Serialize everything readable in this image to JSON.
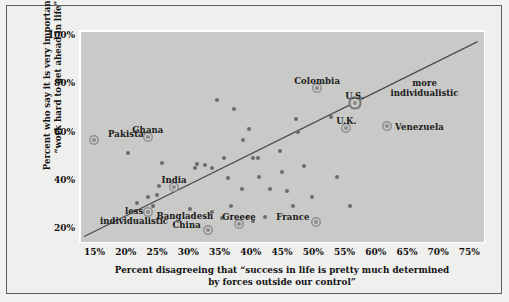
{
  "chart_data": {
    "type": "scatter",
    "title": "",
    "xlabel": "Percent disagreeing that “success in life is pretty much determined by forces outside our control”",
    "xlabel_line1": "Percent disagreeing that “success in life is pretty much determined",
    "xlabel_line2": "by forces outside our control”",
    "ylabel": "Percent who say it is very important to “work hard to get ahead in life”",
    "ylabel_line1": "Percent who say it is very important to",
    "ylabel_line2": "“work hard to get ahead in life”",
    "xlim": [
      12.5,
      77.5
    ],
    "ylim": [
      14,
      102
    ],
    "xticks": [
      "15%",
      "20%",
      "25%",
      "30%",
      "35%",
      "40%",
      "45%",
      "50%",
      "55%",
      "60%",
      "65%",
      "70%",
      "75%"
    ],
    "xtick_values": [
      15,
      20,
      25,
      30,
      35,
      40,
      45,
      50,
      55,
      60,
      65,
      70,
      75
    ],
    "yticks": [
      "100%",
      "80%",
      "60%",
      "40%",
      "20%"
    ],
    "ytick_values": [
      100,
      80,
      60,
      40,
      20
    ],
    "grid": false,
    "legend": "none",
    "trendline": {
      "x0": 13.0,
      "y0": 17.5,
      "x1": 76.0,
      "y1": 98.0
    },
    "labeled_points": [
      {
        "name": "Pakistan",
        "x": 14.6,
        "y": 57.5,
        "label_dx": 14,
        "label_dy": -11,
        "label_align": "left",
        "highlight": "normal"
      },
      {
        "name": "Ghana",
        "x": 23.2,
        "y": 58.5,
        "label_dx": 0,
        "label_dy": -12,
        "label_align": "center",
        "highlight": "normal"
      },
      {
        "name": "India",
        "x": 27.4,
        "y": 38.0,
        "label_dx": 0,
        "label_dy": -12,
        "label_align": "center",
        "highlight": "normal"
      },
      {
        "name": "Bangladesh",
        "x": 23.3,
        "y": 27.5,
        "label_dx": 8,
        "label_dy": -1,
        "label_align": "left",
        "highlight": "normal"
      },
      {
        "name": "China",
        "x": 32.8,
        "y": 20.0,
        "label_dx": -7,
        "label_dy": -10,
        "label_align": "right",
        "highlight": "normal"
      },
      {
        "name": "Greece",
        "x": 37.8,
        "y": 22.5,
        "label_dx": 0,
        "label_dy": -12,
        "label_align": "center",
        "highlight": "normal"
      },
      {
        "name": "France",
        "x": 50.2,
        "y": 23.5,
        "label_dx": -7,
        "label_dy": -10,
        "label_align": "right",
        "highlight": "normal"
      },
      {
        "name": "Colombia",
        "x": 50.3,
        "y": 79.0,
        "label_dx": 0,
        "label_dy": -12,
        "label_align": "center",
        "highlight": "normal"
      },
      {
        "name": "U.S.",
        "x": 56.3,
        "y": 72.5,
        "label_dx": 0,
        "label_dy": -12,
        "label_align": "center",
        "highlight": "big"
      },
      {
        "name": "U.K.",
        "x": 55.0,
        "y": 62.5,
        "label_dx": 0,
        "label_dy": -12,
        "label_align": "center",
        "highlight": "normal"
      },
      {
        "name": "Venezuela",
        "x": 61.5,
        "y": 63.0,
        "label_dx": 8,
        "label_dy": -4,
        "label_align": "left",
        "highlight": "normal"
      }
    ],
    "unlabeled_points": [
      {
        "x": 20.0,
        "y": 52.0
      },
      {
        "x": 25.4,
        "y": 48.0
      },
      {
        "x": 25.0,
        "y": 38.5
      },
      {
        "x": 23.3,
        "y": 34.0
      },
      {
        "x": 24.6,
        "y": 34.5
      },
      {
        "x": 21.5,
        "y": 31.5
      },
      {
        "x": 24.0,
        "y": 30.0
      },
      {
        "x": 30.0,
        "y": 29.0
      },
      {
        "x": 31.0,
        "y": 47.5
      },
      {
        "x": 30.7,
        "y": 45.8
      },
      {
        "x": 32.3,
        "y": 47.0
      },
      {
        "x": 33.4,
        "y": 45.8
      },
      {
        "x": 33.5,
        "y": 27.5
      },
      {
        "x": 35.0,
        "y": 25.0
      },
      {
        "x": 35.4,
        "y": 50.0
      },
      {
        "x": 37.0,
        "y": 70.0
      },
      {
        "x": 36.5,
        "y": 30.0
      },
      {
        "x": 39.4,
        "y": 62.0
      },
      {
        "x": 38.5,
        "y": 57.5
      },
      {
        "x": 40.0,
        "y": 50.0
      },
      {
        "x": 40.8,
        "y": 50.0
      },
      {
        "x": 38.3,
        "y": 37.0
      },
      {
        "x": 39.2,
        "y": 25.5
      },
      {
        "x": 40.0,
        "y": 24.0
      },
      {
        "x": 42.8,
        "y": 37.0
      },
      {
        "x": 42.0,
        "y": 25.5
      },
      {
        "x": 44.3,
        "y": 53.0
      },
      {
        "x": 45.5,
        "y": 36.5
      },
      {
        "x": 47.0,
        "y": 66.0
      },
      {
        "x": 47.2,
        "y": 60.5
      },
      {
        "x": 48.2,
        "y": 46.5
      },
      {
        "x": 44.6,
        "y": 44.0
      },
      {
        "x": 49.5,
        "y": 34.0
      },
      {
        "x": 52.6,
        "y": 67.0
      },
      {
        "x": 53.5,
        "y": 42.0
      },
      {
        "x": 55.5,
        "y": 30.0
      },
      {
        "x": 34.3,
        "y": 74.0
      },
      {
        "x": 36.0,
        "y": 41.5
      },
      {
        "x": 41.0,
        "y": 42.0
      },
      {
        "x": 46.5,
        "y": 30.0
      }
    ],
    "annotations": [
      {
        "text_line1": "less",
        "text_line2": "individualistic",
        "x": 21.0,
        "y": 30.0
      },
      {
        "text_line1": "more",
        "text_line2": "individualistic",
        "x": 67.5,
        "y": 83.0
      }
    ]
  },
  "colors": {
    "background": "#efefed",
    "plot_background": "#c9c9c7",
    "point": "#6b6b6b",
    "trendline": "#4a4a4a",
    "axis": "#ffffff",
    "text": "#111111"
  }
}
